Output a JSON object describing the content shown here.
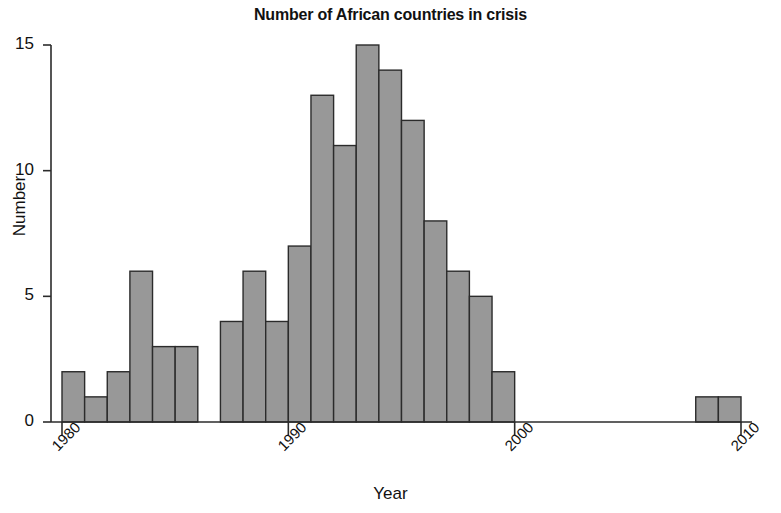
{
  "chart_data": {
    "type": "bar",
    "title": "Number of African countries in crisis",
    "xlabel": "Year",
    "ylabel": "Number",
    "categories": [
      1980,
      1981,
      1982,
      1983,
      1984,
      1985,
      1986,
      1987,
      1988,
      1989,
      1990,
      1991,
      1992,
      1993,
      1994,
      1995,
      1996,
      1997,
      1998,
      1999,
      2000,
      2001,
      2002,
      2003,
      2004,
      2005,
      2006,
      2007,
      2008,
      2009
    ],
    "values": [
      2,
      1,
      2,
      6,
      3,
      3,
      0,
      4,
      6,
      4,
      7,
      13,
      11,
      15,
      14,
      12,
      8,
      6,
      5,
      2,
      0,
      0,
      0,
      0,
      0,
      0,
      0,
      0,
      1,
      1
    ],
    "xlim": [
      1980,
      2010
    ],
    "ylim": [
      0,
      15
    ],
    "ytick_values": [
      0,
      5,
      10,
      15
    ],
    "ytick_labels": [
      "0",
      "5",
      "10",
      "15"
    ],
    "xtick_values": [
      1980,
      1990,
      2000,
      2010
    ],
    "xtick_labels": [
      "1980",
      "1990",
      "2000",
      "2010"
    ],
    "grid": false,
    "legend": null,
    "bar_fill": "#989898",
    "bar_stroke": "#2b2b2b",
    "axis_color": "#2b2b2b"
  }
}
